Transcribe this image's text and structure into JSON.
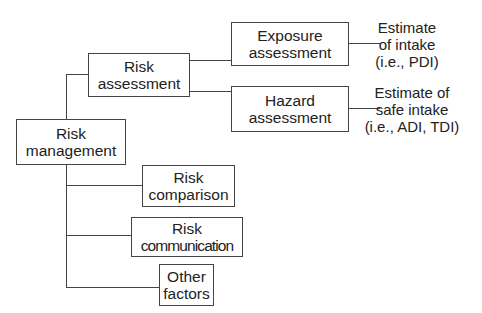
{
  "diagram": {
    "type": "tree",
    "nodes": {
      "risk_management": {
        "line1": "Risk",
        "line2": "management"
      },
      "risk_assessment": {
        "line1": "Risk",
        "line2": "assessment"
      },
      "exposure_assessment": {
        "line1": "Exposure",
        "line2": "assessment"
      },
      "hazard_assessment": {
        "line1": "Hazard",
        "line2": "assessment"
      },
      "risk_comparison": {
        "line1": "Risk",
        "line2": "comparison"
      },
      "risk_communication": {
        "line1": "Risk",
        "line2": "communication"
      },
      "other_factors": {
        "line1": "Other",
        "line2": "factors"
      }
    },
    "outputs": {
      "exposure": {
        "line1": "Estimate",
        "line2": "of intake",
        "line3": "(i.e., PDI)"
      },
      "hazard": {
        "line1": "Estimate of",
        "line2": "safe intake",
        "line3": "(i.e., ADI, TDI)"
      }
    },
    "edges": [
      [
        "risk_management",
        "risk_assessment"
      ],
      [
        "risk_management",
        "risk_comparison"
      ],
      [
        "risk_management",
        "risk_communication"
      ],
      [
        "risk_management",
        "other_factors"
      ],
      [
        "risk_assessment",
        "exposure_assessment"
      ],
      [
        "risk_assessment",
        "hazard_assessment"
      ],
      [
        "exposure_assessment",
        "outputs.exposure"
      ],
      [
        "hazard_assessment",
        "outputs.hazard"
      ]
    ]
  }
}
